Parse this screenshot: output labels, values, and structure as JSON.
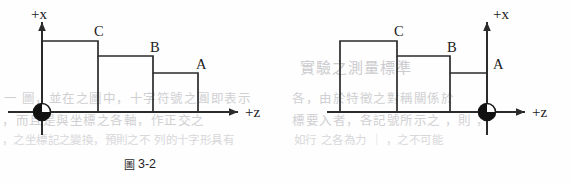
{
  "page": {
    "width": 571,
    "height": 183,
    "background": "#fefefe",
    "ink_color": "#2b2b2b"
  },
  "bleed_through_text": {
    "note": "faint grey show-through text from the reverse of the printed page",
    "color": "#c9c9cc",
    "lines": [
      "一  圖，並在之圖中，十字符號之圓即表示",
      "，而且是與坐標之各軸，作正交之",
      "，之坐標記之變換，預則之不 列的十字形具有",
      "實驗之測量標準",
      "各，由於特徵之對稱關係於",
      "標要入者，各記號所示之  ，則  ，",
      "如行  之各為力 ｜  ，之不可能"
    ]
  },
  "figures": [
    {
      "id": "figure-3-2",
      "caption_cjk": "圖",
      "caption_number": "3-2",
      "axis_vertical_label": "+x",
      "axis_horizontal_label": "+z",
      "origin_marker": "quadrant-filled-circle",
      "origin_position": "left",
      "step_direction": "descending-rightward",
      "steps": [
        {
          "label": "C",
          "order": 1,
          "height_rank": 3
        },
        {
          "label": "B",
          "order": 2,
          "height_rank": 2
        },
        {
          "label": "A",
          "order": 3,
          "height_rank": 1
        }
      ]
    },
    {
      "id": "figure-3-3",
      "caption_cjk": "圖",
      "caption_number": "3-3",
      "axis_vertical_label": "+x",
      "axis_horizontal_label": "+z",
      "origin_marker": "quadrant-filled-circle",
      "origin_position": "right",
      "step_direction": "descending-rightward",
      "steps": [
        {
          "label": "C",
          "order": 1,
          "height_rank": 3
        },
        {
          "label": "B",
          "order": 2,
          "height_rank": 2
        },
        {
          "label": "A",
          "order": 3,
          "height_rank": 1
        }
      ]
    }
  ]
}
